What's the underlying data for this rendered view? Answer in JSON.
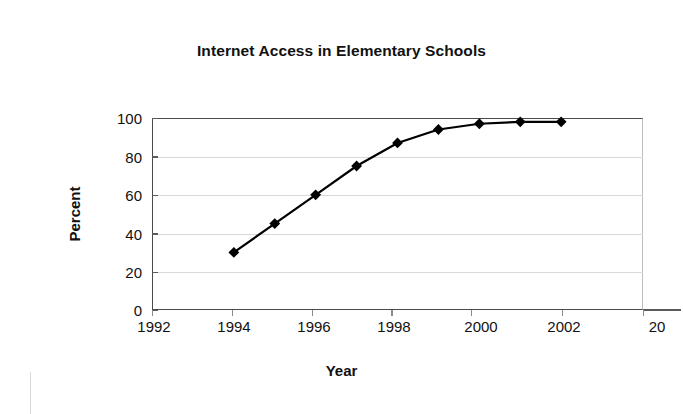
{
  "chart_data": {
    "type": "line",
    "title": "Internet Access in Elementary Schools",
    "xlabel": "Year",
    "ylabel": "Percent",
    "x": [
      1994,
      1995,
      1996,
      1997,
      1998,
      1999,
      2000,
      2001,
      2002
    ],
    "values": [
      30,
      45,
      60,
      75,
      87,
      94,
      97,
      98,
      98
    ],
    "series": [
      {
        "name": "Percent of elementary schools with Internet access",
        "values": [
          30,
          45,
          60,
          75,
          87,
          94,
          97,
          98,
          98
        ]
      }
    ],
    "xlim": [
      1992,
      2004
    ],
    "ylim": [
      0,
      100
    ],
    "xticks": [
      1992,
      1994,
      1996,
      1998,
      2000,
      2002,
      2004
    ],
    "xtick_labels": [
      "1992",
      "1994",
      "1996",
      "1998",
      "2000",
      "2002",
      "20"
    ],
    "yticks": [
      0,
      20,
      40,
      60,
      80,
      100
    ],
    "ytick_labels": [
      "0",
      "20",
      "40",
      "60",
      "80",
      "100"
    ],
    "grid": true,
    "legend": false,
    "marker": "diamond",
    "line_color": "#000000",
    "marker_color": "#000000",
    "grid_color": "#d9d9d9",
    "axis_color": "#4a4a4a",
    "background": "#ffffff"
  }
}
